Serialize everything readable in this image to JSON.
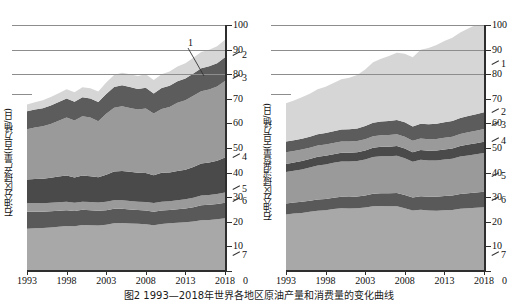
{
  "figure": {
    "caption": "图2 1993—2018年世界各地区原油产量和消费量的变化曲线"
  },
  "axes": {
    "x_ticks": [
      "1993",
      "1998",
      "2003",
      "2008",
      "2013",
      "2018"
    ],
    "x_tick_values": [
      1993,
      1998,
      2003,
      2008,
      2013,
      2018
    ],
    "y_ticks": [
      "0",
      "10",
      "20",
      "30",
      "40",
      "50",
      "60",
      "70",
      "80",
      "90",
      "100"
    ],
    "y_tick_values": [
      0,
      10,
      20,
      30,
      40,
      50,
      60,
      70,
      80,
      90,
      100
    ],
    "zero_label": "0",
    "gridline_values": [
      80,
      90,
      100
    ],
    "xlim": [
      1993,
      2018
    ],
    "ylim": [
      0,
      100
    ]
  },
  "panels": {
    "left": {
      "ylabel": "石油分区域产量(百万桶/日)",
      "callouts": [
        {
          "id": "1",
          "label": "1",
          "y": 90.5
        },
        {
          "id": "2",
          "label": "2",
          "y": 88.0
        },
        {
          "id": "3",
          "label": "3",
          "y": 78.5
        },
        {
          "id": "4",
          "label": "4",
          "y": 46.5
        },
        {
          "id": "5",
          "label": "5",
          "y": 33.5
        },
        {
          "id": "6",
          "label": "6",
          "y": 28.5
        },
        {
          "id": "7",
          "label": "7",
          "y": 6.5
        }
      ]
    },
    "right": {
      "ylabel": "石油分区域消费量(百万桶/日)",
      "callouts": [
        {
          "id": "1",
          "label": "1",
          "y": 84.0
        },
        {
          "id": "2",
          "label": "2",
          "y": 64.5
        },
        {
          "id": "3",
          "label": "3",
          "y": 59.5
        },
        {
          "id": "4",
          "label": "4",
          "y": 53.0
        },
        {
          "id": "5",
          "label": "5",
          "y": 38.5
        },
        {
          "id": "6",
          "label": "6",
          "y": 29.0
        },
        {
          "id": "7",
          "label": "7",
          "y": 6.5
        }
      ]
    }
  },
  "colors": {
    "band_1": "#d6d6d6",
    "band_2": "#5c5c5c",
    "band_3": "#9a9a9a",
    "band_4": "#4a4a4a",
    "band_5": "#9a9a9a",
    "band_6": "#595959",
    "band_7": "#a8a8a8",
    "axis": "#2e2e2e",
    "grid": "#9a9a9a",
    "text": "#111111"
  },
  "chart_data": [
    {
      "type": "area",
      "panel": "left",
      "title": "石油分区域产量(百万桶/日)",
      "xlabel": "",
      "ylabel": "石油分区域产量(百万桶/日)",
      "stacked": true,
      "grid": true,
      "legend": "right-margin-callouts",
      "xlim": [
        1993,
        2018
      ],
      "ylim": [
        0,
        100
      ],
      "x": [
        1993,
        1994,
        1995,
        1996,
        1997,
        1998,
        1999,
        2000,
        2001,
        2002,
        2003,
        2004,
        2005,
        2006,
        2007,
        2008,
        2009,
        2010,
        2011,
        2012,
        2013,
        2014,
        2015,
        2016,
        2017,
        2018
      ],
      "series": [
        {
          "name": "7",
          "color": "#a8a8a8",
          "values": [
            17.2,
            17.4,
            17.5,
            17.7,
            18.0,
            18.3,
            18.2,
            18.7,
            18.6,
            18.5,
            18.8,
            19.4,
            19.5,
            19.3,
            19.2,
            19.0,
            18.6,
            19.1,
            19.4,
            19.6,
            19.8,
            20.1,
            20.6,
            20.7,
            21.0,
            21.4
          ]
        },
        {
          "name": "6",
          "color": "#595959",
          "values": [
            6.9,
            6.7,
            6.6,
            6.6,
            6.5,
            6.4,
            6.2,
            6.2,
            6.1,
            6.0,
            5.9,
            5.9,
            5.8,
            5.7,
            5.6,
            5.6,
            5.5,
            5.5,
            5.4,
            5.5,
            5.6,
            5.8,
            6.1,
            6.2,
            6.2,
            6.3
          ]
        },
        {
          "name": "5",
          "color": "#9a9a9a",
          "values": [
            3.5,
            3.5,
            3.4,
            3.4,
            3.4,
            3.4,
            3.3,
            3.3,
            3.3,
            3.3,
            3.4,
            3.5,
            3.5,
            3.5,
            3.4,
            3.4,
            3.5,
            3.6,
            3.6,
            3.7,
            3.8,
            3.9,
            4.0,
            4.0,
            4.1,
            4.2
          ]
        },
        {
          "name": "4",
          "color": "#4a4a4a",
          "values": [
            9.6,
            9.8,
            10.0,
            10.2,
            10.5,
            10.7,
            10.3,
            10.6,
            10.5,
            10.3,
            11.0,
            11.6,
            11.8,
            11.8,
            11.7,
            11.8,
            11.3,
            11.7,
            11.6,
            11.8,
            12.0,
            12.5,
            13.0,
            13.2,
            13.5,
            14.2
          ]
        },
        {
          "name": "3",
          "color": "#9a9a9a",
          "values": [
            20.4,
            20.9,
            21.3,
            21.9,
            22.7,
            23.6,
            23.2,
            24.1,
            23.9,
            22.8,
            24.8,
            26.0,
            26.4,
            26.0,
            25.7,
            26.3,
            25.1,
            26.0,
            26.7,
            27.8,
            28.2,
            28.9,
            29.4,
            29.7,
            30.2,
            31.1
          ]
        },
        {
          "name": "2",
          "color": "#5c5c5c",
          "values": [
            7.3,
            7.3,
            7.4,
            7.5,
            7.6,
            7.7,
            7.6,
            7.7,
            7.7,
            7.8,
            8.1,
            8.4,
            8.5,
            8.5,
            8.4,
            8.4,
            8.2,
            8.5,
            8.6,
            8.7,
            8.9,
            9.1,
            9.3,
            9.4,
            9.5,
            9.7
          ]
        },
        {
          "name": "1",
          "color": "#d6d6d6",
          "values": [
            2.8,
            3.0,
            3.2,
            3.4,
            3.6,
            3.8,
            3.9,
            4.1,
            4.2,
            4.3,
            4.6,
            4.9,
            5.1,
            5.2,
            5.3,
            5.5,
            5.4,
            5.6,
            5.8,
            6.0,
            6.2,
            6.4,
            6.6,
            6.7,
            6.9,
            7.1
          ]
        }
      ]
    },
    {
      "type": "area",
      "panel": "right",
      "title": "石油分区域消费量(百万桶/日)",
      "xlabel": "",
      "ylabel": "石油分区域消费量(百万桶/日)",
      "stacked": true,
      "grid": true,
      "legend": "right-margin-callouts",
      "xlim": [
        1993,
        2018
      ],
      "ylim": [
        0,
        100
      ],
      "x": [
        1993,
        1994,
        1995,
        1996,
        1997,
        1998,
        1999,
        2000,
        2001,
        2002,
        2003,
        2004,
        2005,
        2006,
        2007,
        2008,
        2009,
        2010,
        2011,
        2012,
        2013,
        2014,
        2015,
        2016,
        2017,
        2018
      ],
      "series": [
        {
          "name": "7",
          "color": "#a8a8a8",
          "values": [
            23.0,
            23.4,
            23.6,
            24.1,
            24.5,
            24.7,
            25.2,
            25.5,
            25.4,
            25.5,
            25.8,
            26.3,
            26.4,
            26.3,
            26.3,
            25.5,
            24.6,
            24.9,
            24.6,
            24.5,
            24.7,
            24.8,
            25.3,
            25.5,
            25.7,
            25.9
          ]
        },
        {
          "name": "6",
          "color": "#595959",
          "values": [
            4.4,
            4.4,
            4.5,
            4.5,
            4.6,
            4.6,
            4.6,
            4.7,
            4.7,
            4.8,
            4.9,
            5.1,
            5.2,
            5.3,
            5.4,
            5.4,
            5.3,
            5.5,
            5.6,
            5.7,
            5.8,
            5.9,
            6.0,
            6.1,
            6.2,
            6.3
          ]
        },
        {
          "name": "5",
          "color": "#9a9a9a",
          "values": [
            12.8,
            13.0,
            13.2,
            13.5,
            13.8,
            14.0,
            14.2,
            14.3,
            14.4,
            14.4,
            14.6,
            14.9,
            15.0,
            15.0,
            15.1,
            14.9,
            14.5,
            14.8,
            14.7,
            14.7,
            14.8,
            14.9,
            15.2,
            15.4,
            15.6,
            15.8
          ]
        },
        {
          "name": "4",
          "color": "#4a4a4a",
          "values": [
            3.3,
            3.3,
            3.4,
            3.4,
            3.5,
            3.5,
            3.5,
            3.6,
            3.6,
            3.6,
            3.7,
            3.8,
            3.9,
            3.9,
            4.0,
            4.0,
            3.9,
            4.0,
            4.0,
            4.1,
            4.1,
            4.2,
            4.3,
            4.4,
            4.4,
            4.5
          ]
        },
        {
          "name": "3",
          "color": "#9a9a9a",
          "values": [
            4.8,
            4.7,
            4.7,
            4.6,
            4.6,
            4.6,
            4.5,
            4.5,
            4.5,
            4.5,
            4.6,
            4.7,
            4.7,
            4.8,
            4.8,
            4.8,
            4.6,
            4.7,
            4.7,
            4.7,
            4.8,
            4.8,
            4.9,
            5.0,
            5.1,
            5.2
          ]
        },
        {
          "name": "2",
          "color": "#5c5c5c",
          "values": [
            4.3,
            4.3,
            4.4,
            4.5,
            4.6,
            4.7,
            4.8,
            4.9,
            5.0,
            5.1,
            5.3,
            5.5,
            5.6,
            5.7,
            5.8,
            5.9,
            5.8,
            6.0,
            6.1,
            6.2,
            6.3,
            6.4,
            6.5,
            6.6,
            6.7,
            6.8
          ]
        },
        {
          "name": "1",
          "color": "#d6d6d6",
          "values": [
            15.6,
            16.2,
            16.8,
            17.5,
            18.3,
            18.8,
            19.6,
            20.4,
            21.0,
            21.8,
            23.0,
            24.6,
            25.5,
            26.4,
            27.3,
            27.8,
            28.2,
            30.0,
            31.0,
            32.0,
            33.0,
            33.8,
            34.8,
            35.6,
            36.4,
            37.2
          ]
        }
      ]
    }
  ]
}
